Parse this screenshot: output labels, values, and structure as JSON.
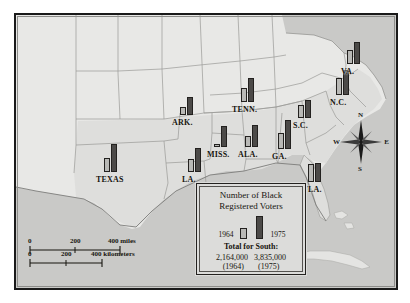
{
  "figure": {
    "type": "choropleth-bar-map",
    "title_in_legend": "Number of Black Registered Voters"
  },
  "legend": {
    "title_line1": "Number of Black",
    "title_line2": "Registered Voters",
    "year_early": "1964",
    "year_late": "1975",
    "total_label": "Total for South:",
    "total_early": "2,164,000",
    "total_late": "3,835,000",
    "total_early_year": "(1964)",
    "total_late_year": "(1975)"
  },
  "compass": {
    "north": "N",
    "south": "S",
    "east": "E",
    "west": "W",
    "icon": "compass-rose-icon"
  },
  "scale": {
    "miles": {
      "ticks": [
        "0",
        "200",
        "400 miles"
      ],
      "unit": "miles"
    },
    "kilometers": {
      "ticks": [
        "0",
        "200",
        "400 kilometers"
      ],
      "unit": "kilometers"
    }
  },
  "colors": {
    "bar_1964": "#b9b9b6",
    "bar_1975": "#4c4a48",
    "bar_outline": "#23211f",
    "water": "#c9c9c7",
    "land_south": "#dededc",
    "land_other": "#e8e8e6",
    "frame": "#1a1a1a"
  },
  "chart_data": {
    "type": "bar",
    "title": "Number of Black Registered Voters",
    "categories": [
      "TEXAS",
      "ARK.",
      "LA.",
      "MISS.",
      "ALA.",
      "TENN.",
      "GA.",
      "FLA.",
      "S.C.",
      "N.C.",
      "VA."
    ],
    "series": [
      {
        "name": "1964",
        "values": [
          14,
          8,
          13,
          3,
          11,
          14,
          16,
          18,
          13,
          17,
          14
        ]
      },
      {
        "name": "1975",
        "values": [
          28,
          18,
          24,
          21,
          22,
          24,
          29,
          19,
          18,
          25,
          22
        ]
      }
    ],
    "legend": [
      "1964",
      "1975"
    ],
    "ylabel": "Registered voters (relative bar height)",
    "annotations": [
      "Total for South: 2,164,000 (1964)",
      "Total for South: 3,835,000 (1975)"
    ]
  },
  "states": [
    {
      "name": "TEXAS",
      "label_x": 96,
      "label_y": 175,
      "bar_x": 104,
      "bar_base_y": 172,
      "h64": 14,
      "h75": 28
    },
    {
      "name": "ARK.",
      "label_x": 172,
      "label_y": 118,
      "bar_x": 180,
      "bar_base_y": 115,
      "h64": 8,
      "h75": 18
    },
    {
      "name": "LA.",
      "label_x": 182,
      "label_y": 175,
      "bar_x": 188,
      "bar_base_y": 172,
      "h64": 13,
      "h75": 24
    },
    {
      "name": "MISS.",
      "label_x": 207,
      "label_y": 150,
      "bar_x": 214,
      "bar_base_y": 147,
      "h64": 3,
      "h75": 21
    },
    {
      "name": "ALA.",
      "label_x": 238,
      "label_y": 150,
      "bar_x": 245,
      "bar_base_y": 147,
      "h64": 11,
      "h75": 22
    },
    {
      "name": "TENN.",
      "label_x": 232,
      "label_y": 105,
      "bar_x": 241,
      "bar_base_y": 102,
      "h64": 14,
      "h75": 24
    },
    {
      "name": "GA.",
      "label_x": 272,
      "label_y": 152,
      "bar_x": 278,
      "bar_base_y": 149,
      "h64": 16,
      "h75": 29
    },
    {
      "name": "FLA.",
      "label_x": 303,
      "label_y": 185,
      "bar_x": 308,
      "bar_base_y": 182,
      "h64": 18,
      "h75": 19
    },
    {
      "name": "S.C.",
      "label_x": 293,
      "label_y": 121,
      "bar_x": 298,
      "bar_base_y": 118,
      "h64": 13,
      "h75": 18
    },
    {
      "name": "N.C.",
      "label_x": 330,
      "label_y": 98,
      "bar_x": 336,
      "bar_base_y": 95,
      "h64": 17,
      "h75": 25
    },
    {
      "name": "VA.",
      "label_x": 341,
      "label_y": 67,
      "bar_x": 347,
      "bar_base_y": 64,
      "h64": 14,
      "h75": 22
    }
  ]
}
